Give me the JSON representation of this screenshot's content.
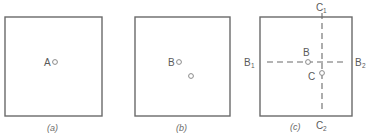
{
  "figure": {
    "panels": [
      {
        "id": "a",
        "caption": "(a)",
        "box": {
          "x": 5,
          "y": 17,
          "w": 97,
          "h": 99
        },
        "points": [
          {
            "label": "A",
            "cx": 55,
            "cy": 62,
            "label_x": 44,
            "label_y": 66
          }
        ]
      },
      {
        "id": "b",
        "caption": "(b)",
        "box": {
          "x": 135,
          "y": 17,
          "w": 95,
          "h": 99
        },
        "points": [
          {
            "label": "B",
            "cx": 179,
            "cy": 62,
            "label_x": 168,
            "label_y": 66
          },
          {
            "label": "",
            "cx": 191,
            "cy": 76
          }
        ]
      },
      {
        "id": "c",
        "caption": "(c)",
        "box": {
          "x": 260,
          "y": 17,
          "w": 92,
          "h": 99
        },
        "points": [
          {
            "label": "B",
            "cx": 308,
            "cy": 62,
            "label_x": 304,
            "label_y": 55
          },
          {
            "label": "C",
            "cx": 322,
            "cy": 72,
            "label_x": 309,
            "label_y": 79
          }
        ],
        "axis_labels": {
          "B1": {
            "main": "B",
            "sub": "1"
          },
          "B2": {
            "main": "B",
            "sub": "2"
          },
          "C1": {
            "main": "C",
            "sub": "1"
          },
          "C2": {
            "main": "C",
            "sub": "2"
          }
        },
        "lines": {
          "horizontal": {
            "y": 62,
            "x1": 267,
            "x2": 345,
            "style": "dashed"
          },
          "vertical": {
            "x": 322,
            "y1": 14,
            "y2": 116,
            "style": "dashed"
          }
        }
      }
    ]
  },
  "labels": {
    "a_point": "A",
    "b_point": "B",
    "c_point_b": "B",
    "c_point_c": "C",
    "c_b1": "B",
    "c_b1_sub": "1",
    "c_b2": "B",
    "c_b2_sub": "2",
    "c_c1": "C",
    "c_c1_sub": "1",
    "c_c2": "C",
    "c_c2_sub": "2",
    "cap_a": "(a)",
    "cap_b": "(b)",
    "cap_c": "(c)"
  }
}
